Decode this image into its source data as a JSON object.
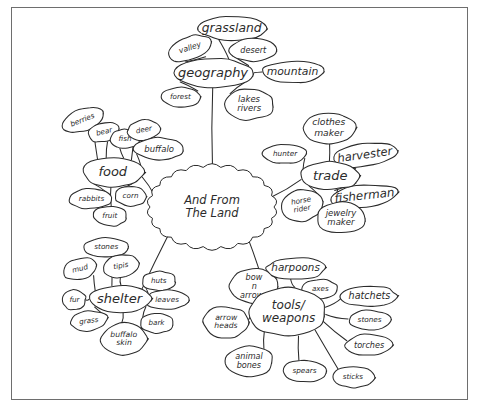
{
  "document": {
    "title": "And From The Land",
    "type": "hand-drawn-mind-map",
    "border_color": "#6e6e6e",
    "ink_color": "#2b2b2b",
    "background_color": "#ffffff"
  },
  "center": {
    "label_line1": "And From",
    "label_line2": "The Land",
    "x": 212,
    "y": 207,
    "rx": 62,
    "ry": 40
  },
  "branches": [
    {
      "id": "geography",
      "label": "geography",
      "x": 213,
      "y": 73,
      "rx": 41,
      "ry": 15,
      "children": [
        {
          "label": "grassland",
          "x": 232,
          "y": 28,
          "rx": 35,
          "ry": 12
        },
        {
          "label": "valley",
          "x": 190,
          "y": 48,
          "rx": 23,
          "ry": 12,
          "rotate": -18
        },
        {
          "label": "desert",
          "x": 253,
          "y": 50,
          "rx": 24,
          "ry": 11
        },
        {
          "label": "mountain",
          "x": 293,
          "y": 72,
          "rx": 31,
          "ry": 11
        },
        {
          "label": "forest",
          "x": 181,
          "y": 97,
          "rx": 21,
          "ry": 10
        },
        {
          "label": "lakes",
          "label2": "rivers",
          "x": 249,
          "y": 104,
          "rx": 25,
          "ry": 16
        }
      ]
    },
    {
      "id": "food",
      "label": "food",
      "x": 113,
      "y": 172,
      "rx": 31,
      "ry": 15,
      "children": [
        {
          "label": "berries",
          "x": 83,
          "y": 120,
          "rx": 22,
          "ry": 11,
          "rotate": -22
        },
        {
          "label": "bear",
          "x": 104,
          "y": 132,
          "rx": 16,
          "ry": 10,
          "rotate": -14
        },
        {
          "label": "fish",
          "x": 125,
          "y": 139,
          "rx": 15,
          "ry": 10
        },
        {
          "label": "deer",
          "x": 144,
          "y": 130,
          "rx": 17,
          "ry": 10,
          "rotate": -10
        },
        {
          "label": "buffalo",
          "x": 159,
          "y": 149,
          "rx": 25,
          "ry": 11
        },
        {
          "label": "rabbits",
          "x": 91,
          "y": 199,
          "rx": 22,
          "ry": 10
        },
        {
          "label": "corn",
          "x": 131,
          "y": 196,
          "rx": 16,
          "ry": 10
        },
        {
          "label": "fruit",
          "x": 110,
          "y": 216,
          "rx": 17,
          "ry": 10
        }
      ]
    },
    {
      "id": "trade",
      "label": "trade",
      "x": 330,
      "y": 176,
      "rx": 30,
      "ry": 14,
      "children": [
        {
          "label": "clothes",
          "label2": "maker",
          "x": 329,
          "y": 128,
          "rx": 27,
          "ry": 16
        },
        {
          "label": "hunter",
          "x": 285,
          "y": 154,
          "rx": 22,
          "ry": 10
        },
        {
          "label": "harvester",
          "x": 365,
          "y": 155,
          "rx": 33,
          "ry": 12,
          "rotate": -8
        },
        {
          "label": "horse",
          "label2": "rider",
          "x": 302,
          "y": 205,
          "rx": 22,
          "ry": 16,
          "rotate": -10
        },
        {
          "label": "fisherman",
          "x": 364,
          "y": 196,
          "rx": 34,
          "ry": 11,
          "rotate": -6
        },
        {
          "label": "jewelry",
          "label2": "maker",
          "x": 341,
          "y": 218,
          "rx": 25,
          "ry": 16
        }
      ]
    },
    {
      "id": "shelter",
      "label": "shelter",
      "x": 120,
      "y": 299,
      "rx": 31,
      "ry": 14,
      "children": [
        {
          "label": "stones",
          "x": 106,
          "y": 247,
          "rx": 22,
          "ry": 10
        },
        {
          "label": "mud",
          "x": 80,
          "y": 269,
          "rx": 17,
          "ry": 11,
          "rotate": -14
        },
        {
          "label": "tipis",
          "x": 121,
          "y": 266,
          "rx": 19,
          "ry": 11,
          "rotate": -10
        },
        {
          "label": "huts",
          "x": 159,
          "y": 281,
          "rx": 17,
          "ry": 10
        },
        {
          "label": "fur",
          "x": 74,
          "y": 300,
          "rx": 12,
          "ry": 10
        },
        {
          "label": "leaves",
          "x": 167,
          "y": 300,
          "rx": 22,
          "ry": 10
        },
        {
          "label": "grass",
          "x": 89,
          "y": 321,
          "rx": 19,
          "ry": 10,
          "rotate": -8
        },
        {
          "label": "bark",
          "x": 157,
          "y": 323,
          "rx": 17,
          "ry": 10
        },
        {
          "label": "buffalo",
          "label2": "skin",
          "x": 124,
          "y": 339,
          "rx": 23,
          "ry": 16
        }
      ]
    },
    {
      "id": "tools-weapons",
      "label": "tools/",
      "label2": "weapons",
      "x": 288,
      "y": 312,
      "rx": 38,
      "ry": 25,
      "children": [
        {
          "label": "bow",
          "label2": "n",
          "label3": "arrows",
          "x": 254,
          "y": 286,
          "rx": 24,
          "ry": 18
        },
        {
          "label": "harpoons",
          "x": 296,
          "y": 268,
          "rx": 30,
          "ry": 11
        },
        {
          "label": "axes",
          "x": 320,
          "y": 289,
          "rx": 18,
          "ry": 10
        },
        {
          "label": "hatchets",
          "x": 369,
          "y": 296,
          "rx": 28,
          "ry": 11
        },
        {
          "label": "arrow",
          "label2": "heads",
          "x": 226,
          "y": 322,
          "rx": 23,
          "ry": 16
        },
        {
          "label": "stones",
          "x": 370,
          "y": 320,
          "rx": 22,
          "ry": 10
        },
        {
          "label": "torches",
          "x": 369,
          "y": 345,
          "rx": 24,
          "ry": 11
        },
        {
          "label": "animal",
          "label2": "bones",
          "x": 249,
          "y": 361,
          "rx": 24,
          "ry": 16
        },
        {
          "label": "spears",
          "x": 305,
          "y": 371,
          "rx": 22,
          "ry": 11
        },
        {
          "label": "sticks",
          "x": 353,
          "y": 377,
          "rx": 21,
          "ry": 11
        }
      ]
    }
  ]
}
